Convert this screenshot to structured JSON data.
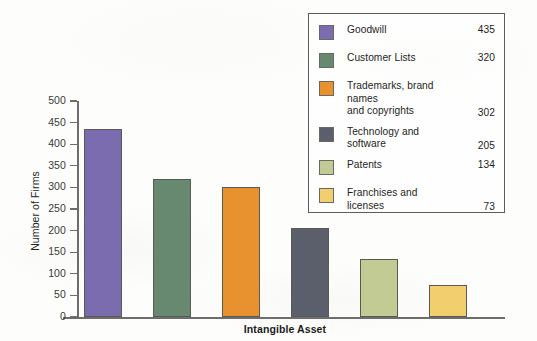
{
  "chart_data": {
    "type": "bar",
    "title": "",
    "xlabel": "Intangible Asset",
    "ylabel": "Number of Firms",
    "ylim": [
      0,
      500
    ],
    "yticks": [
      0,
      50,
      100,
      150,
      200,
      250,
      300,
      350,
      400,
      450,
      500
    ],
    "grid": false,
    "legend_position": "top-right inside",
    "categories": [
      "Goodwill",
      "Customer Lists",
      "Trademarks, brand names and copyrights",
      "Technology and software",
      "Patents",
      "Franchises and licenses"
    ],
    "values": [
      435,
      320,
      302,
      205,
      134,
      73
    ],
    "colors": [
      "#7B6CB0",
      "#67896F",
      "#E8922F",
      "#5B5F6B",
      "#C3CB94",
      "#F2CE6E"
    ]
  },
  "axes": {
    "y_title": "Number of Firms",
    "x_title": "Intangible Asset",
    "y_tick_labels": [
      "500",
      "450",
      "400",
      "350",
      "300",
      "250",
      "200",
      "150",
      "100",
      "50",
      "0"
    ]
  },
  "legend": {
    "items": [
      {
        "label_line1": "Goodwill",
        "label_line2": "",
        "value": "435",
        "color": "#7B6CB0"
      },
      {
        "label_line1": "Customer Lists",
        "label_line2": "",
        "value": "320",
        "color": "#67896F"
      },
      {
        "label_line1": "Trademarks, brand names",
        "label_line2": "and copyrights",
        "value": "302",
        "color": "#E8922F"
      },
      {
        "label_line1": "Technology and",
        "label_line2": "software",
        "value": "205",
        "color": "#5B5F6B"
      },
      {
        "label_line1": "Patents",
        "label_line2": "",
        "value": "134",
        "color": "#C3CB94"
      },
      {
        "label_line1": "Franchises and",
        "label_line2": "licenses",
        "value": "73",
        "color": "#F2CE6E"
      }
    ]
  }
}
